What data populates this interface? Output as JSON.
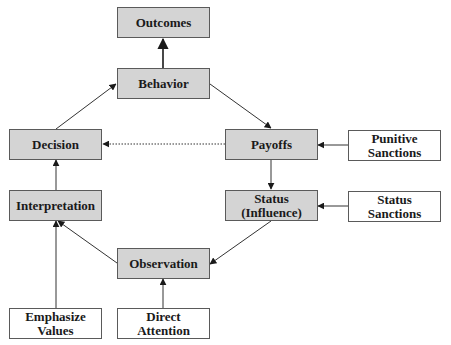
{
  "diagram": {
    "nodes": {
      "outcomes": {
        "label": "Outcomes",
        "type": "core"
      },
      "behavior": {
        "label": "Behavior",
        "type": "core"
      },
      "decision": {
        "label": "Decision",
        "type": "core"
      },
      "payoffs": {
        "label": "Payoffs",
        "type": "core"
      },
      "punitive_sanctions": {
        "label": "Punitive\nSanctions",
        "type": "input"
      },
      "interpretation": {
        "label": "Interpretation",
        "type": "core"
      },
      "status": {
        "label": "Status\n(Influence)",
        "type": "core"
      },
      "status_sanctions": {
        "label": "Status\nSanctions",
        "type": "input"
      },
      "observation": {
        "label": "Observation",
        "type": "core"
      },
      "emphasize_values": {
        "label": "Emphasize\nValues",
        "type": "input"
      },
      "direct_attention": {
        "label": "Direct\nAttention",
        "type": "input"
      }
    },
    "edges": [
      {
        "from": "Behavior",
        "to": "Outcomes",
        "style": "solid"
      },
      {
        "from": "Decision",
        "to": "Behavior",
        "style": "solid"
      },
      {
        "from": "Behavior",
        "to": "Payoffs",
        "style": "solid"
      },
      {
        "from": "Payoffs",
        "to": "Decision",
        "style": "dotted"
      },
      {
        "from": "Punitive Sanctions",
        "to": "Payoffs",
        "style": "solid"
      },
      {
        "from": "Payoffs",
        "to": "Status (Influence)",
        "style": "solid"
      },
      {
        "from": "Status Sanctions",
        "to": "Status (Influence)",
        "style": "solid"
      },
      {
        "from": "Status (Influence)",
        "to": "Observation",
        "style": "solid"
      },
      {
        "from": "Observation",
        "to": "Interpretation",
        "style": "solid"
      },
      {
        "from": "Interpretation",
        "to": "Decision",
        "style": "solid"
      },
      {
        "from": "Emphasize Values",
        "to": "Interpretation",
        "style": "solid"
      },
      {
        "from": "Direct Attention",
        "to": "Observation",
        "style": "solid"
      }
    ],
    "colors": {
      "core_fill": "#d4d4d4",
      "input_fill": "#ffffff",
      "border": "#5a5a5a",
      "line": "#333333"
    }
  }
}
